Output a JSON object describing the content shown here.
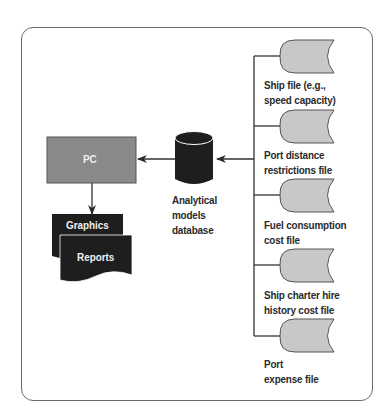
{
  "diagram": {
    "pc": {
      "label": "PC"
    },
    "database": {
      "label_lines": [
        "Analytical",
        "models",
        "database"
      ]
    },
    "outputs": [
      {
        "label": "Graphics"
      },
      {
        "label": "Reports"
      }
    ],
    "files": [
      {
        "line1": "Ship file (e.g.,",
        "line2": "speed capacity)"
      },
      {
        "line1": "Port distance",
        "line2": "restrictions file"
      },
      {
        "line1": "Fuel consumption",
        "line2": "cost file"
      },
      {
        "line1": "Ship charter hire",
        "line2": "history cost file"
      },
      {
        "line1": "Port",
        "line2": "expense file"
      }
    ],
    "colors": {
      "frame": "#6a6a6a",
      "pc_box": "#8a8a8a",
      "file_fill": "#c8c8c8",
      "dark": "#1e1e1e",
      "line": "#333333"
    }
  }
}
